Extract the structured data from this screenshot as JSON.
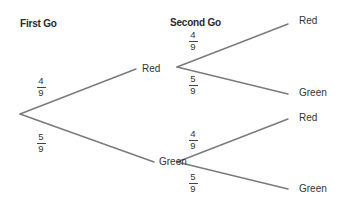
{
  "headings": {
    "first": "First Go",
    "second": "Second Go"
  },
  "colors": {
    "line": "#777777",
    "text": "#333333",
    "background": "#ffffff"
  },
  "tree": {
    "root": {
      "branches": [
        {
          "probability": {
            "numerator": "4",
            "denominator": "9"
          },
          "outcome": "Red",
          "branches": [
            {
              "probability": {
                "numerator": "4",
                "denominator": "9"
              },
              "outcome": "Red"
            },
            {
              "probability": {
                "numerator": "5",
                "denominator": "9"
              },
              "outcome": "Green"
            }
          ]
        },
        {
          "probability": {
            "numerator": "5",
            "denominator": "9"
          },
          "outcome": "Green",
          "branches": [
            {
              "probability": {
                "numerator": "4",
                "denominator": "9"
              },
              "outcome": "Red"
            },
            {
              "probability": {
                "numerator": "5",
                "denominator": "9"
              },
              "outcome": "Green"
            }
          ]
        }
      ]
    }
  }
}
